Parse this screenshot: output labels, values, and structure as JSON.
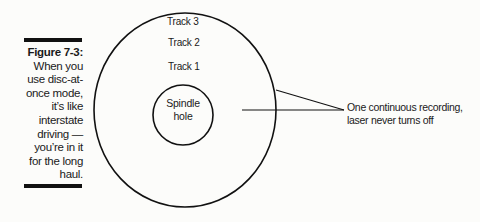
{
  "figure": {
    "number_label": "Figure 7-3:",
    "caption_lines": [
      "When you",
      "use disc-at-",
      "once mode,",
      "it’s like",
      "interstate",
      "driving —",
      "you’re in it",
      "for the long",
      "haul."
    ]
  },
  "diagram": {
    "tracks": [
      "Track 3",
      "Track 2",
      "Track 1"
    ],
    "spindle_lines": [
      "Spindle",
      "hole"
    ],
    "annotation_lines": [
      "One continuous recording,",
      "laser never turns off"
    ],
    "stroke_color": "#111111"
  }
}
